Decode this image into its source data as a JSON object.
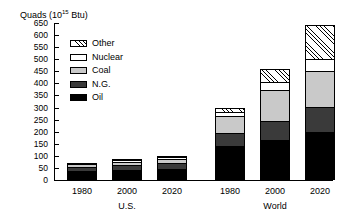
{
  "chart_data": {
    "type": "bar",
    "title_prefix": "Quads (10",
    "title_exponent": "15",
    "title_suffix": " Btu)",
    "xlabel": "",
    "ylabel": "Quads (10^15 Btu)",
    "ylim": [
      0,
      650
    ],
    "ytick_step": 50,
    "grid": false,
    "stacked": true,
    "legend_position": "upper-left-inside",
    "yticks": [
      "650",
      "600",
      "550",
      "500",
      "450",
      "400",
      "350",
      "300",
      "250",
      "200",
      "150",
      "100",
      "50",
      "0"
    ],
    "ytick_values": [
      650,
      600,
      550,
      500,
      450,
      400,
      350,
      300,
      250,
      200,
      150,
      100,
      50,
      0
    ],
    "groups": [
      {
        "name": "U.S.",
        "categories": [
          "1980",
          "2000",
          "2020"
        ]
      },
      {
        "name": "World",
        "categories": [
          "1980",
          "2000",
          "2020"
        ]
      }
    ],
    "categories": [
      "1980",
      "2000",
      "2020",
      "1980",
      "2000",
      "2020"
    ],
    "series": [
      {
        "name": "Oil",
        "color": "#000000",
        "values": [
          34,
          38,
          42,
          135,
          160,
          195
        ]
      },
      {
        "name": "N.G.",
        "color": "#3a3a3a",
        "values": [
          20,
          22,
          26,
          55,
          80,
          105
        ]
      },
      {
        "name": "Coal",
        "color": "#c9c9c9",
        "values": [
          15,
          17,
          20,
          75,
          130,
          150
        ]
      },
      {
        "name": "Nuclear",
        "color": "#ffffff",
        "values": [
          3,
          5,
          7,
          15,
          35,
          50
        ]
      },
      {
        "name": "Other",
        "color": "hatch",
        "values": [
          0,
          3,
          5,
          20,
          55,
          140
        ]
      }
    ],
    "totals": [
      72,
      85,
      100,
      300,
      460,
      640
    ],
    "legend": [
      {
        "label": "Other",
        "pattern": "hatched"
      },
      {
        "label": "Nuclear",
        "pattern": "white"
      },
      {
        "label": "Coal",
        "pattern": "light-gray"
      },
      {
        "label": "N.G.",
        "pattern": "dark-gray"
      },
      {
        "label": "Oil",
        "pattern": "black"
      }
    ]
  }
}
